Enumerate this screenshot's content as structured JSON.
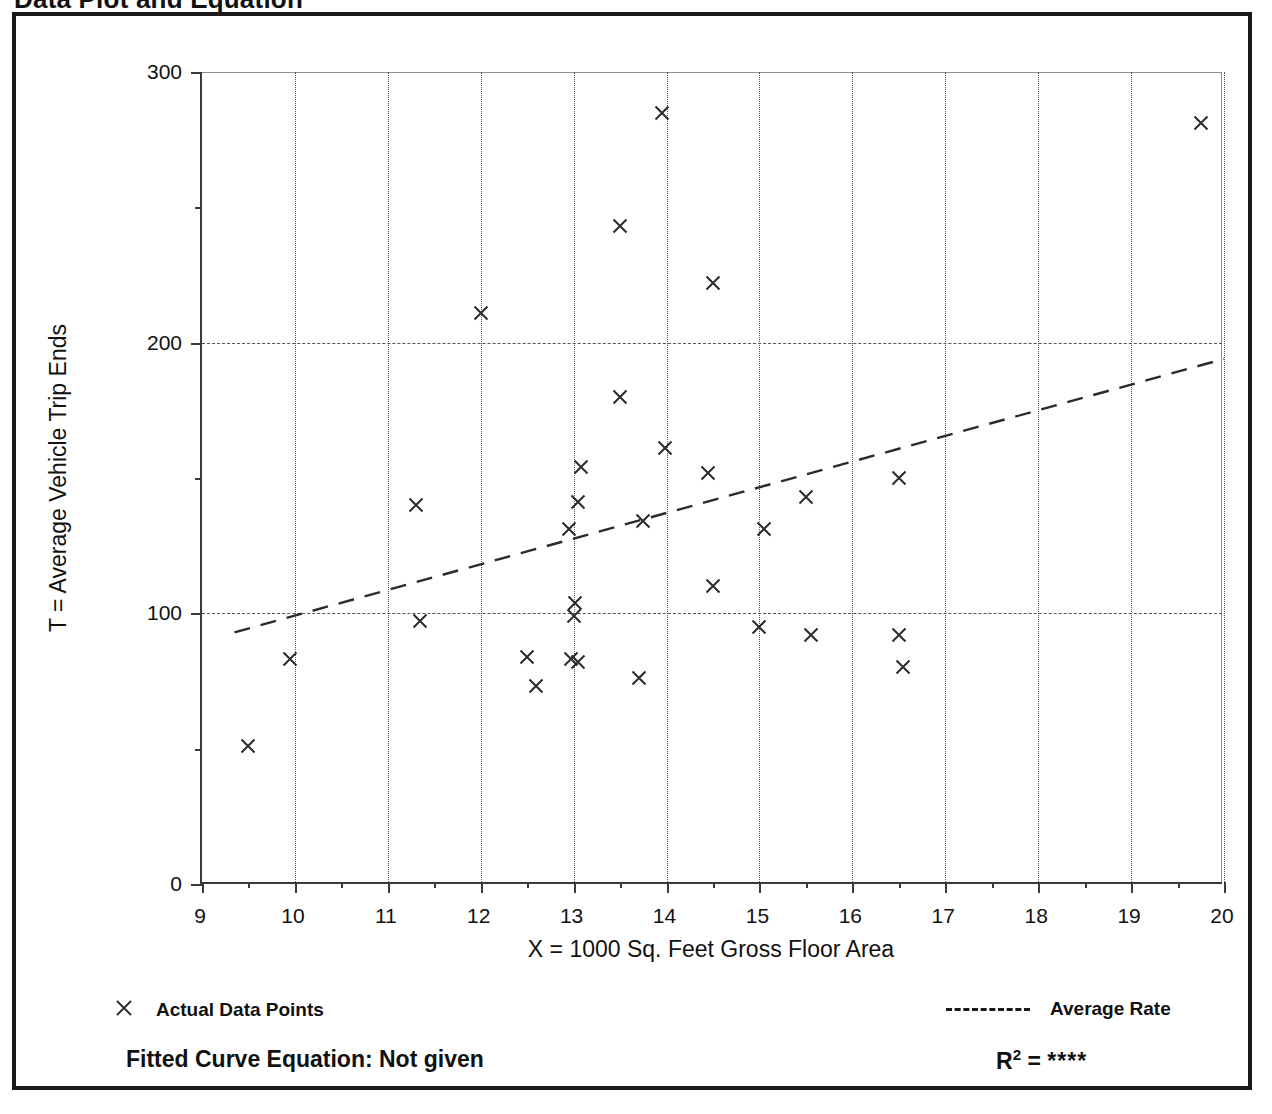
{
  "document": {
    "title": "Data Plot and Equation"
  },
  "chart_data": {
    "type": "scatter",
    "title": "Data Plot and Equation",
    "xlabel": "X = 1000 Sq. Feet Gross Floor Area",
    "ylabel": "T = Average Vehicle Trip Ends",
    "xlim": [
      9,
      20
    ],
    "ylim": [
      0,
      300
    ],
    "x_major_ticks": [
      9,
      10,
      11,
      12,
      13,
      14,
      15,
      16,
      17,
      18,
      19,
      20
    ],
    "x_minor_tick_step": 0.5,
    "y_major_ticks": [
      0,
      100,
      200,
      300
    ],
    "y_minor_tick_step": 50,
    "x_tick_labels": [
      "9",
      "10",
      "11",
      "12",
      "13",
      "14",
      "15",
      "16",
      "17",
      "18",
      "19",
      "20"
    ],
    "y_tick_labels": [
      "0",
      "100",
      "200",
      "300"
    ],
    "grid": true,
    "grid_style": "dotted vertical at each integer X, dashed horizontal at 100 / 200",
    "legend_position": "below-plot",
    "series": [
      {
        "name": "Actual Data Points",
        "marker": "x",
        "points": [
          [
            9.5,
            51
          ],
          [
            9.95,
            83
          ],
          [
            11.3,
            140
          ],
          [
            11.35,
            97
          ],
          [
            12.0,
            211
          ],
          [
            12.5,
            84
          ],
          [
            12.6,
            73
          ],
          [
            12.95,
            131
          ],
          [
            12.97,
            83
          ],
          [
            13.05,
            82
          ],
          [
            13.02,
            104
          ],
          [
            13.0,
            99
          ],
          [
            13.05,
            141
          ],
          [
            13.08,
            154
          ],
          [
            13.5,
            180
          ],
          [
            13.5,
            243
          ],
          [
            13.7,
            76
          ],
          [
            13.75,
            134
          ],
          [
            13.95,
            285
          ],
          [
            13.98,
            161
          ],
          [
            14.45,
            152
          ],
          [
            14.5,
            222
          ],
          [
            14.5,
            110
          ],
          [
            15.0,
            95
          ],
          [
            15.05,
            131
          ],
          [
            15.5,
            143
          ],
          [
            15.55,
            92
          ],
          [
            16.5,
            150
          ],
          [
            16.5,
            92
          ],
          [
            16.55,
            80
          ],
          [
            19.75,
            281
          ]
        ]
      },
      {
        "name": "Average Rate",
        "style": "dashed-line",
        "points": [
          [
            9.35,
            93
          ],
          [
            20.0,
            194
          ]
        ]
      }
    ]
  },
  "legend": {
    "actual_data_points_label": "Actual Data Points",
    "average_rate_label": "Average Rate"
  },
  "footer": {
    "equation_label": "Fitted Curve Equation:  Not given",
    "r2_prefix": "R",
    "r2_exponent": "2",
    "r2_equals": " = ",
    "r2_value": "****"
  }
}
